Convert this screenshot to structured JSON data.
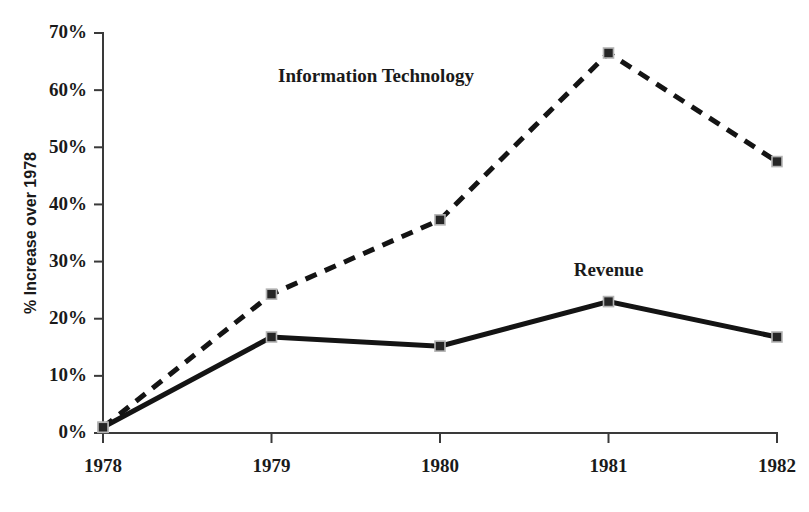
{
  "chart_data": {
    "type": "line",
    "title": "",
    "subtitle": "",
    "xlabel": "",
    "ylabel": "% Increase over 1978",
    "categories": [
      "1978",
      "1979",
      "1980",
      "1981",
      "1982"
    ],
    "x": [
      1978,
      1979,
      1980,
      1981,
      1982
    ],
    "xlim": [
      1978,
      1982
    ],
    "ylim": [
      0,
      70
    ],
    "y_tick_labels": [
      "0%",
      "10%",
      "20%",
      "30%",
      "40%",
      "50%",
      "60%",
      "70%"
    ],
    "y_tick_values": [
      0,
      10,
      20,
      30,
      40,
      50,
      60,
      70
    ],
    "x_tick_labels": [
      "1978",
      "1979",
      "1980",
      "1981",
      "1982"
    ],
    "grid": false,
    "legend_position": "inline-annotation",
    "series": [
      {
        "name": "Information Technology",
        "style": "dashed",
        "marker": "square",
        "color": "#141414",
        "values": [
          1,
          24.3,
          37.3,
          66.5,
          47.5
        ],
        "label_x": 1979.62,
        "label_y": 61.5
      },
      {
        "name": "Revenue",
        "style": "solid",
        "marker": "square",
        "color": "#141414",
        "values": [
          1,
          16.8,
          15.2,
          23,
          16.8
        ],
        "label_x": 1981.0,
        "label_y": 27.5
      }
    ],
    "annotations": [
      {
        "text": "Information Technology",
        "series": "Information Technology"
      },
      {
        "text": "Revenue",
        "series": "Revenue"
      }
    ]
  },
  "colors": {
    "axis": "#3a3a3a",
    "text": "#1a1a1a",
    "series": "#141414",
    "marker_fill": "#262626",
    "marker_stroke": "#b4b4b4",
    "background": "#ffffff"
  }
}
